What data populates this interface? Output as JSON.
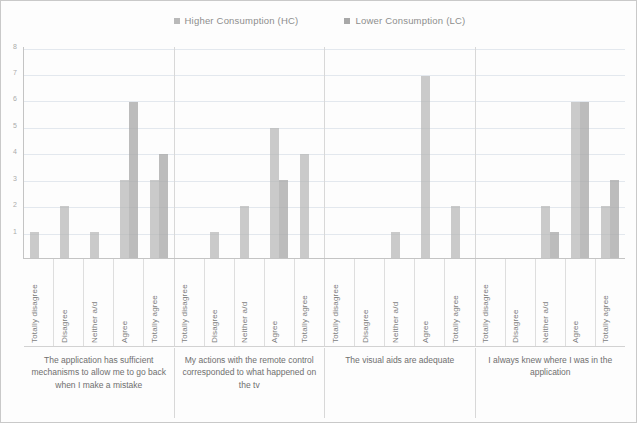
{
  "legend": {
    "items": [
      {
        "label": "Higher Consumption (HC)",
        "color": "#b9b9b9",
        "key": "HC"
      },
      {
        "label": "Lower Consumption (LC)",
        "color": "#a8a8a8",
        "key": "LC"
      }
    ]
  },
  "axis": {
    "y_ticks": [
      "8",
      "7",
      "6",
      "5",
      "4",
      "3",
      "2",
      "1"
    ]
  },
  "categories": [
    "Totally disagree",
    "Disagree",
    "Neither a/d",
    "Agree",
    "Totally agree"
  ],
  "groups": [
    {
      "caption": "The application has sufficient mechanisms to allow me to go back when I make a mistake"
    },
    {
      "caption": "My actions with the remote control corresponded to what happened on the tv"
    },
    {
      "caption": "The visual aids are adequate"
    },
    {
      "caption": "I always knew where I was in the application"
    }
  ],
  "chart_data": {
    "type": "bar",
    "title": "",
    "xlabel": "",
    "ylabel": "",
    "ylim": [
      0,
      8
    ],
    "grid": true,
    "legend_position": "top-center",
    "categories": [
      "Totally disagree",
      "Disagree",
      "Neither a/d",
      "Agree",
      "Totally agree"
    ],
    "group_labels": [
      "The application has sufficient mechanisms to allow me to go back when I make a mistake",
      "My actions with the remote control corresponded to what happened on the tv",
      "The visual aids are adequate",
      "I always knew where I was in the application"
    ],
    "series": [
      {
        "name": "Higher Consumption (HC)",
        "color": "#b9b9b9",
        "values_by_group": [
          [
            1,
            2,
            1,
            3,
            3
          ],
          [
            0,
            1,
            2,
            5,
            4
          ],
          [
            0,
            0,
            1,
            7,
            2
          ],
          [
            0,
            0,
            2,
            6,
            2
          ]
        ]
      },
      {
        "name": "Lower Consumption (LC)",
        "color": "#a8a8a8",
        "values_by_group": [
          [
            0,
            0,
            0,
            6,
            4
          ],
          [
            0,
            0,
            0,
            3,
            0
          ],
          [
            0,
            0,
            0,
            0,
            0
          ],
          [
            0,
            0,
            1,
            6,
            3
          ]
        ]
      }
    ]
  }
}
